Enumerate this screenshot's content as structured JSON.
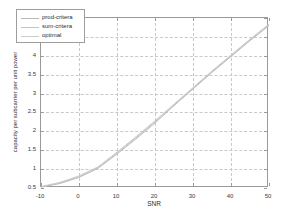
{
  "chart_data": {
    "type": "line",
    "title": "",
    "xlabel": "SNR",
    "ylabel": "capacity per subcarrier per unit power",
    "xlim": [
      -10,
      50
    ],
    "ylim": [
      0.5,
      5
    ],
    "xticks": [
      -10,
      0,
      10,
      20,
      30,
      40,
      50
    ],
    "xtick_labels": [
      "-10",
      "0",
      "10",
      "20",
      "30",
      "40",
      "50"
    ],
    "yticks": [
      0.5,
      1,
      1.5,
      2,
      2.5,
      3,
      3.5,
      4,
      4.5,
      5
    ],
    "ytick_labels": [
      "0.5",
      "1",
      "1.5",
      "2",
      "2.5",
      "3",
      "3.5",
      "4",
      "4.5",
      "5"
    ],
    "grid": true,
    "grid_style": "dashed",
    "grid_color": "#c9c9c9",
    "legend_position": "upper left",
    "x": [
      -10,
      -5,
      0,
      5,
      10,
      15,
      20,
      25,
      30,
      35,
      40,
      45,
      50
    ],
    "series": [
      {
        "name": "prod-critera",
        "color": "#b9b9b9",
        "values": [
          0.52,
          0.62,
          0.78,
          1.02,
          1.4,
          1.8,
          2.22,
          2.68,
          3.12,
          3.56,
          3.98,
          4.4,
          4.8
        ]
      },
      {
        "name": "sum-critera",
        "color": "#c3c3c3",
        "values": [
          0.53,
          0.63,
          0.8,
          1.04,
          1.43,
          1.83,
          2.25,
          2.7,
          3.14,
          3.58,
          4.0,
          4.42,
          4.82
        ]
      },
      {
        "name": "optimal",
        "color": "#cccccc",
        "values": [
          0.54,
          0.65,
          0.82,
          1.06,
          1.45,
          1.86,
          2.28,
          2.72,
          3.16,
          3.6,
          4.02,
          4.44,
          4.84
        ]
      }
    ]
  },
  "legend": {
    "entries": [
      {
        "label": "prod-critera"
      },
      {
        "label": "sum-critera"
      },
      {
        "label": "optimal"
      }
    ]
  },
  "axes": {
    "x_label": "SNR",
    "y_label": "capacity per subcarrier per unit power"
  }
}
